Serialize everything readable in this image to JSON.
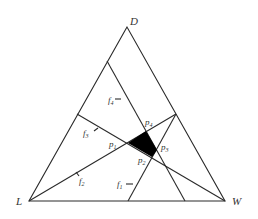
{
  "diagram": {
    "type": "ternary-feasibility-diagram",
    "vertices": {
      "D": {
        "label": "D",
        "x": 127,
        "y": 27
      },
      "L": {
        "label": "L",
        "x": 29,
        "y": 201
      },
      "W": {
        "label": "W",
        "x": 225,
        "y": 201
      }
    },
    "lines": [
      {
        "name": "f1",
        "label": "f",
        "sub": "1",
        "from": [
          128,
          201
        ],
        "to": [
          176,
          114
        ]
      },
      {
        "name": "f2",
        "label": "f",
        "sub": "2",
        "from": [
          29,
          201
        ],
        "to": [
          176,
          114
        ]
      },
      {
        "name": "f3",
        "label": "f",
        "sub": "3",
        "from": [
          77,
          114
        ],
        "to": [
          225,
          201
        ]
      },
      {
        "name": "f4",
        "label": "f",
        "sub": "4",
        "from": [
          107,
          61
        ],
        "to": [
          185,
          201
        ]
      }
    ],
    "points": [
      {
        "name": "p1",
        "label": "p",
        "sub": "1",
        "x": 128,
        "y": 143
      },
      {
        "name": "p2",
        "label": "p",
        "sub": "2",
        "x": 152,
        "y": 157
      },
      {
        "name": "p3",
        "label": "p",
        "sub": "3",
        "x": 157,
        "y": 150
      },
      {
        "name": "p4",
        "label": "p",
        "sub": "4",
        "x": 146,
        "y": 131
      }
    ],
    "feasible_region": {
      "vertices": [
        "p1",
        "p4",
        "p3",
        "p2"
      ],
      "fill": "#000000"
    },
    "stroke_color": "#2a2a2a"
  },
  "labels": {
    "D": "D",
    "L": "L",
    "W": "W",
    "f": "f",
    "p": "p",
    "s1": "1",
    "s2": "2",
    "s3": "3",
    "s4": "4"
  }
}
